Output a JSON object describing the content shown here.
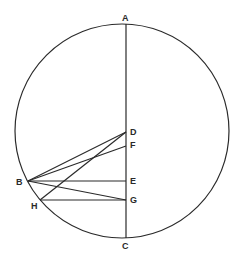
{
  "diagram": {
    "type": "geometry-construction",
    "circle": {
      "label": "circle"
    },
    "points": [
      {
        "id": "A",
        "label": "A",
        "role": "top of diameter"
      },
      {
        "id": "C",
        "label": "C",
        "role": "bottom of diameter"
      },
      {
        "id": "D",
        "label": "D",
        "role": "point on diameter AC"
      },
      {
        "id": "F",
        "label": "F",
        "role": "point on diameter AC"
      },
      {
        "id": "E",
        "label": "E",
        "role": "point on diameter AC"
      },
      {
        "id": "G",
        "label": "G",
        "role": "point on diameter AC"
      },
      {
        "id": "B",
        "label": "B",
        "role": "point on circle"
      },
      {
        "id": "H",
        "label": "H",
        "role": "point on circle"
      }
    ],
    "segments": [
      [
        "A",
        "C"
      ],
      [
        "B",
        "D"
      ],
      [
        "B",
        "F"
      ],
      [
        "B",
        "E"
      ],
      [
        "B",
        "G"
      ],
      [
        "H",
        "D"
      ],
      [
        "H",
        "G"
      ]
    ]
  }
}
